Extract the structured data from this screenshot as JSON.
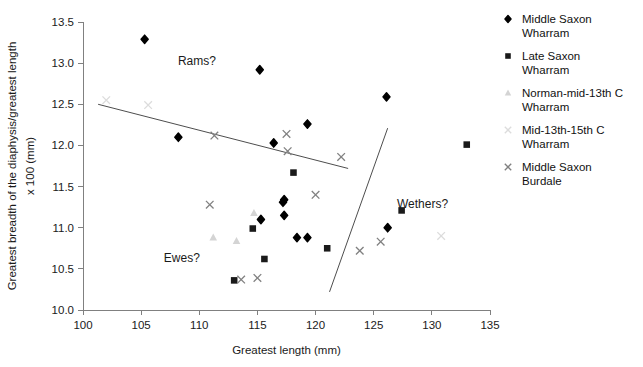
{
  "chart_data": {
    "type": "scatter",
    "title": "",
    "xlabel": "Greatest length (mm)",
    "ylabel": "Greatest breadth of the diaphysis/greatest length x 100 (mm)",
    "ylabel_line1": "Greatest breadth of the diaphysis/greatest length",
    "ylabel_line2": "x 100 (mm)",
    "xlim": [
      100,
      135
    ],
    "ylim": [
      10.0,
      13.5
    ],
    "xticks": [
      100,
      105,
      110,
      115,
      120,
      125,
      130,
      135
    ],
    "yticks": [
      "10.0",
      "10.5",
      "11.0",
      "11.5",
      "12.0",
      "12.5",
      "13.0",
      "13.5"
    ],
    "grid": false,
    "legend_position": "right",
    "series": [
      {
        "name": "Middle Saxon Wharram",
        "marker": "diamond",
        "color": "#000000",
        "points": [
          [
            105.3,
            13.29
          ],
          [
            115.2,
            12.92
          ],
          [
            126.1,
            12.59
          ],
          [
            119.3,
            12.26
          ],
          [
            108.2,
            12.1
          ],
          [
            116.4,
            12.03
          ],
          [
            117.3,
            11.34
          ],
          [
            117.2,
            11.31
          ],
          [
            117.3,
            11.15
          ],
          [
            115.3,
            11.1
          ],
          [
            118.4,
            10.88
          ],
          [
            119.3,
            10.88
          ],
          [
            126.2,
            11.0
          ]
        ]
      },
      {
        "name": "Late Saxon Wharram",
        "marker": "square",
        "color": "#1a1a1a",
        "points": [
          [
            133.0,
            12.01
          ],
          [
            118.1,
            11.67
          ],
          [
            127.4,
            11.21
          ],
          [
            114.6,
            10.99
          ],
          [
            121.0,
            10.75
          ],
          [
            115.6,
            10.62
          ],
          [
            113.0,
            10.36
          ]
        ]
      },
      {
        "name": "Norman-mid-13th C Wharram",
        "marker": "triangle",
        "color": "#d4d4d4",
        "points": [
          [
            114.7,
            11.18
          ],
          [
            111.2,
            10.88
          ],
          [
            113.2,
            10.84
          ]
        ]
      },
      {
        "name": "Mid-13th-15th C Wharram",
        "marker": "cross",
        "color": "#dcdcdc",
        "points": [
          [
            102.0,
            12.55
          ],
          [
            105.6,
            12.49
          ],
          [
            130.8,
            10.9
          ]
        ]
      },
      {
        "name": "Middle Saxon Burdale",
        "marker": "cross",
        "color": "#808080",
        "points": [
          [
            111.3,
            12.12
          ],
          [
            117.5,
            12.14
          ],
          [
            117.6,
            11.93
          ],
          [
            122.2,
            11.86
          ],
          [
            120.0,
            11.4
          ],
          [
            110.9,
            11.28
          ],
          [
            125.6,
            10.83
          ],
          [
            123.8,
            10.72
          ],
          [
            113.6,
            10.37
          ],
          [
            115.0,
            10.39
          ]
        ]
      }
    ],
    "fit_line": {
      "name": "regression-line",
      "x0": 101.3,
      "y0": 12.5,
      "x1": 122.8,
      "y1": 11.72
    },
    "divider_line": {
      "name": "group-divider-line",
      "x0": 121.2,
      "y0": 10.22,
      "x1": 126.2,
      "y1": 12.21
    },
    "annotations": [
      {
        "text": "Rams?",
        "x": 109.8,
        "y": 12.98
      },
      {
        "text": "Ewes?",
        "x": 108.5,
        "y": 10.58
      },
      {
        "text": "Wethers?",
        "x": 129.2,
        "y": 11.24
      }
    ]
  },
  "legend": {
    "items": [
      {
        "label": "Middle Saxon\nWharram",
        "marker": "diamond",
        "color": "#000000"
      },
      {
        "label": "Late Saxon\nWharram",
        "marker": "square",
        "color": "#1a1a1a"
      },
      {
        "label": "Norman-mid-13th C\nWharram",
        "marker": "triangle",
        "color": "#d4d4d4"
      },
      {
        "label": "Mid-13th-15th C\nWharram",
        "marker": "cross",
        "color": "#dcdcdc"
      },
      {
        "label": "Middle Saxon\nBurdale",
        "marker": "cross",
        "color": "#808080"
      }
    ]
  }
}
